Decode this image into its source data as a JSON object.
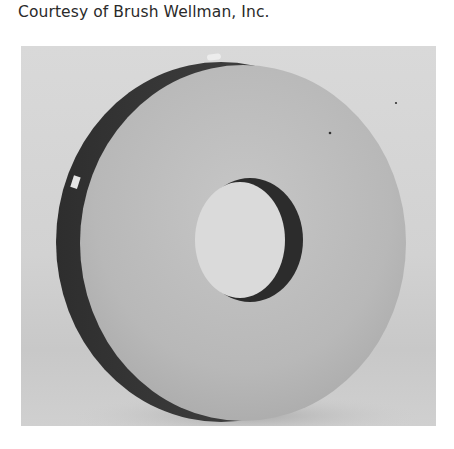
{
  "caption": {
    "text": "Courtesy of Brush Wellman, Inc."
  },
  "photo": {
    "subject": "beryllium-disc-with-center-hole",
    "colors": {
      "background": "#d6d6d6",
      "disc_face": "#bdbdbd",
      "disc_rim": "#3a3a3a",
      "hole_inner": "#dcdcdc",
      "hole_wall": "#2c2c2c"
    }
  }
}
